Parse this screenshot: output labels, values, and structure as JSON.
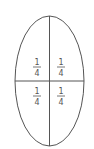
{
  "diagram": {
    "shape": "ellipse",
    "stroke_color": "#555555",
    "background": "#ffffff",
    "quadrants": [
      {
        "position": "top-left",
        "numerator": "1",
        "denominator": "4"
      },
      {
        "position": "top-right",
        "numerator": "1",
        "denominator": "4"
      },
      {
        "position": "bottom-left",
        "numerator": "1",
        "denominator": "4"
      },
      {
        "position": "bottom-right",
        "numerator": "1",
        "denominator": "4"
      }
    ]
  }
}
